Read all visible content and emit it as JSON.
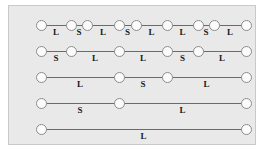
{
  "figure": {
    "panel_background": "#e9e9e9",
    "panel_border_color": "#c9c9c9",
    "node_fill": "#fbfbfb",
    "node_stroke": "#8c8c8c",
    "edge_color": "#6b6b6b",
    "label_color": "#1a1a1a",
    "label_legend": {
      "L": "L",
      "S": "S"
    },
    "rows": [
      {
        "row_index": 1,
        "node_count": 9,
        "node_x": [
          32,
          62,
          78,
          110,
          127,
          158,
          189,
          205,
          237
        ],
        "segments": [
          {
            "label": "L",
            "x": 47
          },
          {
            "label": "S",
            "x": 70
          },
          {
            "label": "L",
            "x": 94
          },
          {
            "label": "S",
            "x": 118.5
          },
          {
            "label": "L",
            "x": 142.5
          },
          {
            "label": "L",
            "x": 173.5
          },
          {
            "label": "S",
            "x": 197
          },
          {
            "label": "L",
            "x": 221
          }
        ]
      },
      {
        "row_index": 2,
        "node_count": 6,
        "node_x": [
          32,
          62,
          110,
          158,
          189,
          237
        ],
        "segments": [
          {
            "label": "S",
            "x": 47
          },
          {
            "label": "L",
            "x": 86
          },
          {
            "label": "L",
            "x": 134
          },
          {
            "label": "S",
            "x": 173.5
          },
          {
            "label": "L",
            "x": 213
          }
        ]
      },
      {
        "row_index": 3,
        "node_count": 4,
        "node_x": [
          32,
          110,
          158,
          237
        ],
        "segments": [
          {
            "label": "L",
            "x": 71
          },
          {
            "label": "S",
            "x": 134
          },
          {
            "label": "L",
            "x": 197.5
          }
        ]
      },
      {
        "row_index": 4,
        "node_count": 3,
        "node_x": [
          32,
          110,
          237
        ],
        "segments": [
          {
            "label": "S",
            "x": 71
          },
          {
            "label": "L",
            "x": 173.5
          }
        ]
      },
      {
        "row_index": 5,
        "node_count": 2,
        "node_x": [
          32,
          237
        ],
        "segments": [
          {
            "label": "L",
            "x": 134.5
          }
        ]
      }
    ]
  }
}
